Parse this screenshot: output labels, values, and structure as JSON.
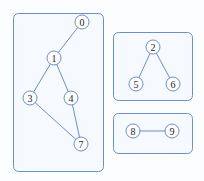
{
  "diagram": {
    "type": "graph-connected-components",
    "components": [
      {
        "id": "component-a",
        "box": {
          "x": 13,
          "y": 13,
          "w": 90,
          "h": 158
        }
      },
      {
        "id": "component-b",
        "box": {
          "x": 113,
          "y": 32,
          "w": 79,
          "h": 68
        }
      },
      {
        "id": "component-c",
        "box": {
          "x": 113,
          "y": 113,
          "w": 79,
          "h": 40
        }
      }
    ],
    "nodes": [
      {
        "label": "0",
        "x": 82,
        "y": 22
      },
      {
        "label": "1",
        "x": 54,
        "y": 58
      },
      {
        "label": "3",
        "x": 30,
        "y": 98
      },
      {
        "label": "4",
        "x": 71,
        "y": 98
      },
      {
        "label": "7",
        "x": 81,
        "y": 144
      },
      {
        "label": "2",
        "x": 153,
        "y": 47
      },
      {
        "label": "5",
        "x": 136,
        "y": 84
      },
      {
        "label": "6",
        "x": 173,
        "y": 84
      },
      {
        "label": "8",
        "x": 133,
        "y": 131
      },
      {
        "label": "9",
        "x": 172,
        "y": 131
      }
    ],
    "edges": [
      [
        "0",
        "1"
      ],
      [
        "1",
        "3"
      ],
      [
        "1",
        "4"
      ],
      [
        "3",
        "7"
      ],
      [
        "4",
        "7"
      ],
      [
        "2",
        "5"
      ],
      [
        "2",
        "6"
      ],
      [
        "8",
        "9"
      ]
    ],
    "colors": {
      "stroke": "#6b90c4",
      "box_fill": "#f6f9fd",
      "node_fill": "#ffffff",
      "text": "#222222"
    }
  }
}
